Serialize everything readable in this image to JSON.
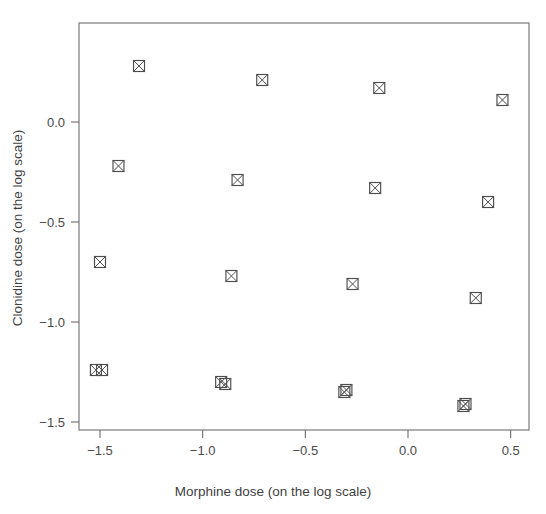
{
  "chart_data": {
    "type": "scatter",
    "title": "",
    "xlabel": "Morphine dose (on the log scale)",
    "ylabel": "Clonidine dose (on the log scale)",
    "xlim": [
      -1.6,
      0.59
    ],
    "ylim": [
      -1.54,
      0.495
    ],
    "xticks": [
      -1.5,
      -1.0,
      -0.5,
      0.0,
      0.5
    ],
    "xticklabels": [
      "-1.5",
      "-1.0",
      "-0.5",
      "0.0",
      "0.5"
    ],
    "yticks": [
      0.0,
      -0.5,
      -1.0,
      -1.5
    ],
    "yticklabels": [
      "0.0",
      "-0.5",
      "-1.0",
      "-1.5"
    ],
    "grid": false,
    "legend": null,
    "marker": "square-with-x",
    "marker_color": "#4d4d4d",
    "points": [
      {
        "x": -1.31,
        "y": 0.28
      },
      {
        "x": -0.71,
        "y": 0.21
      },
      {
        "x": -0.14,
        "y": 0.17
      },
      {
        "x": 0.46,
        "y": 0.11
      },
      {
        "x": -1.41,
        "y": -0.22
      },
      {
        "x": -0.83,
        "y": -0.29
      },
      {
        "x": -0.16,
        "y": -0.33
      },
      {
        "x": 0.39,
        "y": -0.4
      },
      {
        "x": -1.5,
        "y": -0.7
      },
      {
        "x": -0.86,
        "y": -0.77
      },
      {
        "x": -0.27,
        "y": -0.81
      },
      {
        "x": 0.33,
        "y": -0.88
      },
      {
        "x": -1.52,
        "y": -1.24
      },
      {
        "x": -0.91,
        "y": -1.3
      },
      {
        "x": -0.3,
        "y": -1.34
      },
      {
        "x": 0.28,
        "y": -1.41
      },
      {
        "x": -1.49,
        "y": -1.24
      },
      {
        "x": -0.89,
        "y": -1.31
      },
      {
        "x": -0.31,
        "y": -1.35
      },
      {
        "x": 0.27,
        "y": -1.42
      }
    ]
  },
  "axes": {
    "x_title": "Morphine dose (on the log scale)",
    "y_title": "Clonidine dose (on the log scale)"
  },
  "colors": {
    "axis": "#6e6e6e",
    "text": "#3f3f3f",
    "marker": "#4d4d4d",
    "background": "#ffffff"
  }
}
